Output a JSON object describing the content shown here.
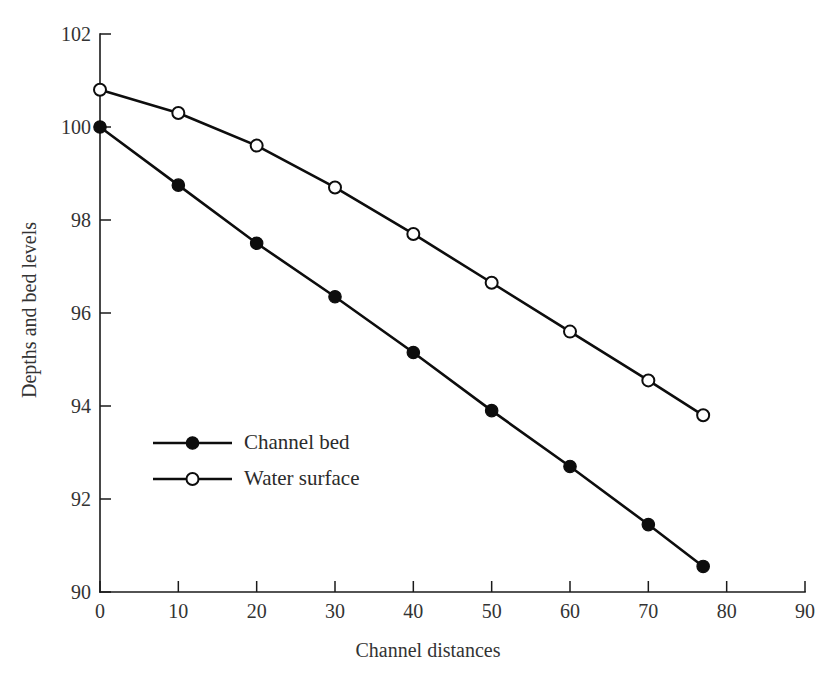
{
  "chart_data": {
    "type": "line",
    "title": "",
    "xlabel": "Channel distances",
    "ylabel": "Depths and bed levels",
    "xlim": [
      0,
      90
    ],
    "ylim": [
      90,
      102
    ],
    "xticks": [
      0,
      10,
      20,
      30,
      40,
      50,
      60,
      70,
      80,
      90
    ],
    "yticks": [
      90,
      92,
      94,
      96,
      98,
      100,
      102
    ],
    "xtick_labels": [
      "0",
      "10",
      "20",
      "30",
      "40",
      "50",
      "60",
      "70",
      "80",
      "90"
    ],
    "ytick_labels": [
      "90",
      "92",
      "94",
      "96",
      "98",
      "100",
      "102"
    ],
    "grid": false,
    "legend_position": "center-left",
    "x": [
      0,
      10,
      20,
      30,
      40,
      50,
      60,
      70,
      77
    ],
    "series": [
      {
        "name": "Channel bed",
        "marker": "filled-circle",
        "color": "#0d0d0d",
        "values": [
          100.0,
          98.75,
          97.5,
          96.35,
          95.15,
          93.9,
          92.7,
          91.45,
          90.55
        ]
      },
      {
        "name": "Water surface",
        "marker": "open-circle",
        "color": "#0d0d0d",
        "values": [
          100.8,
          100.3,
          99.6,
          98.7,
          97.7,
          96.65,
          95.6,
          94.55,
          93.8
        ]
      }
    ]
  },
  "legend": {
    "entries": [
      {
        "label": "Channel bed",
        "marker": "filled-circle"
      },
      {
        "label": "Water surface",
        "marker": "open-circle"
      }
    ]
  },
  "axes": {
    "x_title": "Channel distances",
    "y_title": "Depths and bed levels"
  },
  "colors": {
    "ink": "#0d0d0d",
    "text": "#333333",
    "background": "#ffffff"
  }
}
